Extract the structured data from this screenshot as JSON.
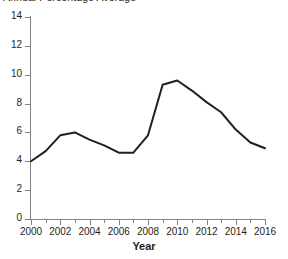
{
  "chart_data": {
    "type": "line",
    "title": "Annual Percentage Average",
    "xlabel": "Year",
    "ylabel": "",
    "xlim": [
      2000,
      2016
    ],
    "ylim": [
      0,
      14
    ],
    "ytick_values": [
      0,
      2,
      4,
      6,
      8,
      10,
      12,
      14
    ],
    "ytick_labels": [
      "0",
      "2",
      "4",
      "6",
      "8",
      "10",
      "12",
      "14"
    ],
    "xtick_values": [
      2000,
      2002,
      2004,
      2006,
      2008,
      2010,
      2012,
      2014,
      2016
    ],
    "xtick_labels": [
      "2000",
      "2002",
      "2004",
      "2006",
      "2008",
      "2010",
      "2012",
      "2014",
      "2016"
    ],
    "xtick_minor_values": [
      2001,
      2003,
      2005,
      2007,
      2009,
      2011,
      2013,
      2015
    ],
    "grid": false,
    "legend": false,
    "line_color": "#231f20",
    "line_width": 2,
    "x": [
      2000,
      2001,
      2002,
      2003,
      2004,
      2005,
      2006,
      2007,
      2008,
      2009,
      2010,
      2011,
      2012,
      2013,
      2014,
      2015,
      2016
    ],
    "values": [
      4.0,
      4.7,
      5.8,
      6.0,
      5.5,
      5.1,
      4.6,
      4.6,
      5.8,
      9.3,
      9.6,
      8.9,
      8.1,
      7.4,
      6.2,
      5.3,
      4.9
    ],
    "series": [
      {
        "name": "Annual Percentage Average",
        "values": [
          4.0,
          4.7,
          5.8,
          6.0,
          5.5,
          5.1,
          4.6,
          4.6,
          5.8,
          9.3,
          9.6,
          8.9,
          8.1,
          7.4,
          6.2,
          5.3,
          4.9
        ]
      }
    ],
    "annotations": []
  },
  "axis": {
    "axis_color": "#808285"
  }
}
